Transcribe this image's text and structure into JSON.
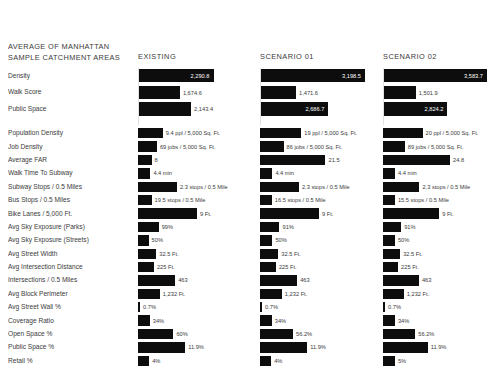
{
  "header": {
    "title_line1": "AVERAGE OF MANHATTAN",
    "title_line2": "SAMPLE CATCHMENT AREAS",
    "columns": [
      "EXISTING",
      "SCENARIO 01",
      "SCENARIO 02"
    ]
  },
  "chart_data": {
    "type": "bar",
    "title": "AVERAGE OF MANHATTAN SAMPLE CATCHMENT AREAS",
    "xlabel": "",
    "ylabel": "",
    "grid": false,
    "legend_position": "top",
    "series_names": [
      "EXISTING",
      "SCENARIO 01",
      "SCENARIO 02"
    ],
    "bar_color": "#0d0d0d",
    "groups": [
      {
        "name": "primary",
        "rows": [
          {
            "category": "Density",
            "cells": [
              {
                "series": "EXISTING",
                "label": "2,290.8",
                "frac": 0.64
              },
              {
                "series": "SCENARIO 01",
                "label": "3,198.5",
                "frac": 0.89
              },
              {
                "series": "SCENARIO 02",
                "label": "3,583.7",
                "frac": 1.0
              }
            ]
          },
          {
            "category": "Walk Score",
            "cells": [
              {
                "series": "EXISTING",
                "label": "1,674.6",
                "frac": 0.355
              },
              {
                "series": "SCENARIO 01",
                "label": "1,471.6",
                "frac": 0.305
              },
              {
                "series": "SCENARIO 02",
                "label": "1,501.9",
                "frac": 0.315
              }
            ]
          },
          {
            "category": "Public Space",
            "cells": [
              {
                "series": "EXISTING",
                "label": "2,143.4",
                "frac": 0.45
              },
              {
                "series": "SCENARIO 01",
                "label": "2,686.7",
                "frac": 0.58
              },
              {
                "series": "SCENARIO 02",
                "label": "2,824.2",
                "frac": 0.62
              }
            ]
          }
        ]
      },
      {
        "name": "metrics",
        "rows": [
          {
            "category": "Population Density",
            "cells": [
              {
                "series": "EXISTING",
                "label": "9.4 ppl / 5,000 Sq. Ft.",
                "frac": 0.21
              },
              {
                "series": "SCENARIO 01",
                "label": "19 ppl / 5,000 Sq. Ft.",
                "frac": 0.35
              },
              {
                "series": "SCENARIO 02",
                "label": "20 ppl / 5,000 Sq. Ft.",
                "frac": 0.38
              }
            ]
          },
          {
            "category": "Job Density",
            "cells": [
              {
                "series": "EXISTING",
                "label": "69 jobs / 5,000 Sq. Ft.",
                "frac": 0.16
              },
              {
                "series": "SCENARIO 01",
                "label": "86 jobs / 5,000 Sq. Ft.",
                "frac": 0.2
              },
              {
                "series": "SCENARIO 02",
                "label": "89 jobs / 5,000 Sq. Ft.",
                "frac": 0.21
              }
            ]
          },
          {
            "category": "Average FAR",
            "cells": [
              {
                "series": "EXISTING",
                "label": "8",
                "frac": 0.115
              },
              {
                "series": "SCENARIO 01",
                "label": "21.5",
                "frac": 0.555
              },
              {
                "series": "SCENARIO 02",
                "label": "24.8",
                "frac": 0.645
              }
            ]
          },
          {
            "category": "Walk Time To Subway",
            "cells": [
              {
                "series": "EXISTING",
                "label": "4.4 min",
                "frac": 0.105
              },
              {
                "series": "SCENARIO 01",
                "label": "4.4 min",
                "frac": 0.105
              },
              {
                "series": "SCENARIO 02",
                "label": "4.4 min",
                "frac": 0.115
              }
            ]
          },
          {
            "category": "Subway Stops / 0.5 Miles",
            "cells": [
              {
                "series": "EXISTING",
                "label": "2.3 stops / 0.5 Mile",
                "frac": 0.33
              },
              {
                "series": "SCENARIO 01",
                "label": "2.3 stops / 0.5 Mile",
                "frac": 0.33
              },
              {
                "series": "SCENARIO 02",
                "label": "2.3 stops / 0.5 Mile",
                "frac": 0.35
              }
            ]
          },
          {
            "category": "Bus Stops / 0.5 Miles",
            "cells": [
              {
                "series": "EXISTING",
                "label": "19.5 stops / 0.5 Mile",
                "frac": 0.115
              },
              {
                "series": "SCENARIO 01",
                "label": "16.5 stops / 0.5 Mile",
                "frac": 0.1
              },
              {
                "series": "SCENARIO 02",
                "label": "15.5 stops / 0.5 Mile",
                "frac": 0.115
              }
            ]
          },
          {
            "category": "Bike Lanes / 5,000 Ft.",
            "cells": [
              {
                "series": "EXISTING",
                "label": "9 Ft.",
                "frac": 0.5
              },
              {
                "series": "SCENARIO 01",
                "label": "9 Ft.",
                "frac": 0.5
              },
              {
                "series": "SCENARIO 02",
                "label": "9 Ft.",
                "frac": 0.54
              }
            ]
          },
          {
            "category": "Avg Sky Exposure (Parks)",
            "cells": [
              {
                "series": "EXISTING",
                "label": "99%",
                "frac": 0.175
              },
              {
                "series": "SCENARIO 01",
                "label": "91%",
                "frac": 0.165
              },
              {
                "series": "SCENARIO 02",
                "label": "91%",
                "frac": 0.175
              }
            ]
          },
          {
            "category": "Avg Sky Exposure (Streets)",
            "cells": [
              {
                "series": "EXISTING",
                "label": "50%",
                "frac": 0.09
              },
              {
                "series": "SCENARIO 01",
                "label": "50%",
                "frac": 0.105
              },
              {
                "series": "SCENARIO 02",
                "label": "50%",
                "frac": 0.115
              }
            ]
          },
          {
            "category": "Avg Street Width",
            "cells": [
              {
                "series": "EXISTING",
                "label": "32.5 Ft.",
                "frac": 0.155
              },
              {
                "series": "SCENARIO 01",
                "label": "32.5 Ft.",
                "frac": 0.155
              },
              {
                "series": "SCENARIO 02",
                "label": "32.5 Ft.",
                "frac": 0.165
              }
            ]
          },
          {
            "category": "Avg Intersection Distance",
            "cells": [
              {
                "series": "EXISTING",
                "label": "225 Ft.",
                "frac": 0.135
              },
              {
                "series": "SCENARIO 01",
                "label": "225 Ft.",
                "frac": 0.135
              },
              {
                "series": "SCENARIO 02",
                "label": "225 Ft.",
                "frac": 0.145
              }
            ]
          },
          {
            "category": "Intersections / 0.5 Miles",
            "cells": [
              {
                "series": "EXISTING",
                "label": "463",
                "frac": 0.315
              },
              {
                "series": "SCENARIO 01",
                "label": "463",
                "frac": 0.315
              },
              {
                "series": "SCENARIO 02",
                "label": "463",
                "frac": 0.345
              }
            ]
          },
          {
            "category": "Avg Block Perimeter",
            "cells": [
              {
                "series": "EXISTING",
                "label": "1,232 Ft.",
                "frac": 0.185
              },
              {
                "series": "SCENARIO 01",
                "label": "1,232 Ft.",
                "frac": 0.185
              },
              {
                "series": "SCENARIO 02",
                "label": "1,232 Ft.",
                "frac": 0.2
              }
            ]
          },
          {
            "category": "Avg Street Wall %",
            "cells": [
              {
                "series": "EXISTING",
                "label": "0.7%",
                "frac": 0.012
              },
              {
                "series": "SCENARIO 01",
                "label": "0.7%",
                "frac": 0.012
              },
              {
                "series": "SCENARIO 02",
                "label": "0.7%",
                "frac": 0.012
              }
            ]
          },
          {
            "category": "Coverage Ratio",
            "cells": [
              {
                "series": "EXISTING",
                "label": "34%",
                "frac": 0.1
              },
              {
                "series": "SCENARIO 01",
                "label": "34%",
                "frac": 0.1
              },
              {
                "series": "SCENARIO 02",
                "label": "34%",
                "frac": 0.115
              }
            ]
          },
          {
            "category": "Open Space %",
            "cells": [
              {
                "series": "EXISTING",
                "label": "60%",
                "frac": 0.3
              },
              {
                "series": "SCENARIO 01",
                "label": "56.2%",
                "frac": 0.28
              },
              {
                "series": "SCENARIO 02",
                "label": "56.2%",
                "frac": 0.31
              }
            ]
          },
          {
            "category": "Public Space %",
            "cells": [
              {
                "series": "EXISTING",
                "label": "11.9%",
                "frac": 0.4
              },
              {
                "series": "SCENARIO 01",
                "label": "11.9%",
                "frac": 0.4
              },
              {
                "series": "SCENARIO 02",
                "label": "11.9%",
                "frac": 0.43
              }
            ]
          },
          {
            "category": "Retail %",
            "cells": [
              {
                "series": "EXISTING",
                "label": "4%",
                "frac": 0.095
              },
              {
                "series": "SCENARIO 01",
                "label": "4%",
                "frac": 0.095
              },
              {
                "series": "SCENARIO 02",
                "label": "5%",
                "frac": 0.115
              }
            ]
          }
        ]
      }
    ]
  }
}
